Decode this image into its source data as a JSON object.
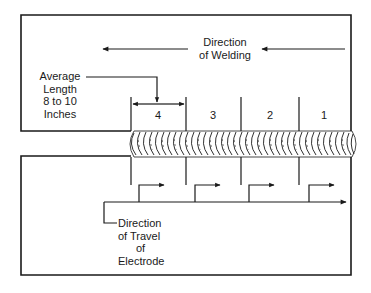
{
  "diagram": {
    "welding_direction": {
      "line1": "Direction",
      "line2": "of Welding"
    },
    "average_length": {
      "line1": "Average",
      "line2": "Length",
      "line3": "8 to 10",
      "line4": "Inches"
    },
    "segments": [
      {
        "label": "4"
      },
      {
        "label": "3"
      },
      {
        "label": "2"
      },
      {
        "label": "1"
      }
    ],
    "electrode_travel": {
      "line1": "Direction",
      "line2": "of Travel",
      "line3": "of",
      "line4": "Electrode"
    },
    "colors": {
      "line": "#1a1a1a",
      "background": "#ffffff"
    }
  }
}
